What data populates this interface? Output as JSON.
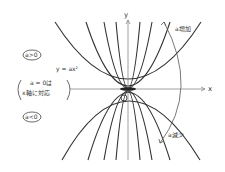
{
  "diagram": {
    "axis_x_label": "x",
    "axis_y_label": "y",
    "origin_label": "O",
    "equation_label": "y = ax²",
    "case_positive": "a>0",
    "case_negative": "a<0",
    "note_line1": "a = 0は",
    "note_line2": "x軸に対応",
    "arrow_up_label": "a増加",
    "arrow_down_label": "a減少",
    "stroke_color": "#333333"
  }
}
